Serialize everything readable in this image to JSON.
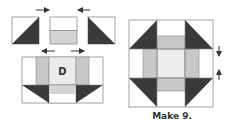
{
  "diagram": {
    "center_label": "D",
    "caption": "Make 9.",
    "colors": {
      "dark": "#3a3a3a",
      "medium": "#c8c8c8",
      "light": "#e9e9e9",
      "white": "#ffffff",
      "outline": "#8a8a8a",
      "arrow": "#333333"
    },
    "step1_units": [
      "half-square-triangle-left",
      "two-strip-square",
      "half-square-triangle-right"
    ],
    "pressing_arrows": {
      "top_row": [
        "right",
        "left"
      ],
      "middle_row": [
        "left",
        "right"
      ],
      "finished_block": [
        "down",
        "up"
      ]
    }
  }
}
